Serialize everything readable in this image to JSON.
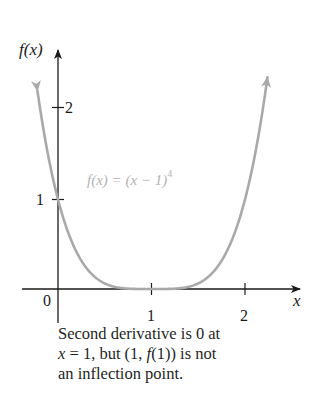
{
  "chart_data": {
    "type": "line",
    "title": "",
    "xlabel": "x",
    "ylabel": "f(x)",
    "xlim": [
      -0.38,
      2.6
    ],
    "ylim": [
      -0.38,
      2.6
    ],
    "grid": false,
    "x_ticks": [
      0,
      1,
      2
    ],
    "x_tick_labels": [
      "0",
      "1",
      "2"
    ],
    "y_ticks": [
      1,
      2
    ],
    "y_tick_labels": [
      "1",
      "2"
    ],
    "series": [
      {
        "name": "f(x) = (x − 1)^4",
        "function": "(x-1)^4",
        "color": "#a9a9a9",
        "x": [
          -0.22,
          -0.1,
          0,
          0.1,
          0.2,
          0.3,
          0.4,
          0.5,
          0.6,
          0.7,
          0.8,
          0.9,
          1.0,
          1.1,
          1.2,
          1.3,
          1.4,
          1.5,
          1.6,
          1.7,
          1.8,
          1.9,
          2.0,
          2.1,
          2.2,
          2.24
        ],
        "values": [
          2.215,
          1.464,
          1.0,
          0.656,
          0.41,
          0.24,
          0.13,
          0.063,
          0.026,
          0.008,
          0.002,
          0.0001,
          0.0,
          0.0001,
          0.002,
          0.008,
          0.026,
          0.063,
          0.13,
          0.24,
          0.41,
          0.656,
          1.0,
          1.464,
          2.074,
          2.364
        ]
      }
    ],
    "annotations": [
      {
        "text": "f(x) = (x − 1)⁴",
        "position": [
          0.58,
          1.12
        ],
        "color": "#a9a9a9"
      }
    ],
    "origin_label": "0"
  },
  "labels": {
    "y_axis": "f(x)",
    "x_axis": "x",
    "origin": "0",
    "x_tick_1": "1",
    "x_tick_2": "2",
    "y_tick_1": "1",
    "y_tick_2": "2",
    "curve_label_main": "f(x) = (x  − 1)",
    "curve_label_exp": "4"
  },
  "caption": {
    "line1": "Second derivative is 0 at",
    "line2_x": "x",
    "line2_rest": " = 1, but (1, ",
    "line2_f": "f",
    "line2_end": "(1)) is not",
    "line3": "an inflection point."
  },
  "colors": {
    "axis": "#1a1a1a",
    "curve": "#a9a9a9",
    "curve_label": "#b3b3b3",
    "text": "#1f1f1f"
  }
}
